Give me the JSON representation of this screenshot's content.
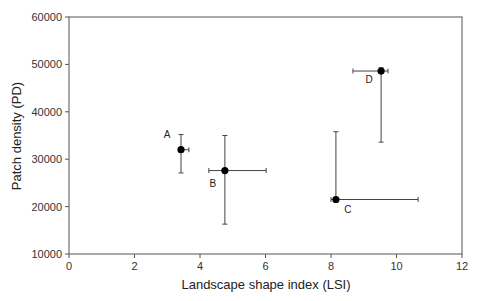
{
  "chart_data": {
    "type": "scatter",
    "title": "",
    "xlabel": "Landscape shape index (LSI)",
    "ylabel": "Patch density (PD)",
    "xlim": [
      0,
      12
    ],
    "ylim": [
      10000,
      60000
    ],
    "xticks": [
      0,
      2,
      4,
      6,
      8,
      10,
      12
    ],
    "yticks": [
      10000,
      20000,
      30000,
      40000,
      50000,
      60000
    ],
    "grid": false,
    "legend": null,
    "points": [
      {
        "label": "A",
        "x": 3.42,
        "y": 32000,
        "x_err_low": 3.42,
        "x_err_high": 3.66,
        "y_err_low": 27100,
        "y_err_high": 35200,
        "label_dx": -14,
        "label_dy": -12
      },
      {
        "label": "B",
        "x": 4.76,
        "y": 27600,
        "x_err_low": 4.27,
        "x_err_high": 6.02,
        "y_err_low": 16300,
        "y_err_high": 35000,
        "label_dx": -12,
        "label_dy": 16
      },
      {
        "label": "C",
        "x": 8.15,
        "y": 21500,
        "x_err_low": 8.0,
        "x_err_high": 10.66,
        "y_err_low": 21500,
        "y_err_high": 35800,
        "label_dx": 12,
        "label_dy": 14
      },
      {
        "label": "D",
        "x": 9.53,
        "y": 48600,
        "x_err_low": 8.67,
        "x_err_high": 9.74,
        "y_err_low": 33600,
        "y_err_high": 49300,
        "label_dx": -12,
        "label_dy": 12
      }
    ]
  }
}
